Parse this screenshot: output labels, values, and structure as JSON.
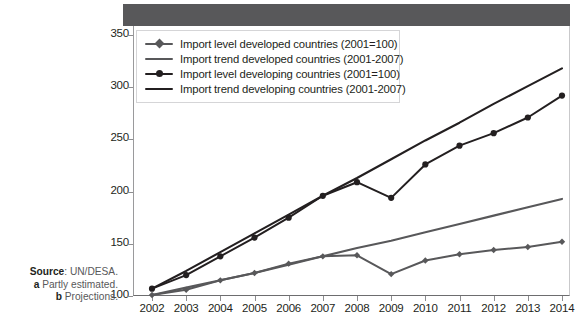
{
  "chart_data": {
    "type": "line",
    "title": "",
    "xlabel": "",
    "ylabel": "",
    "xlim": [
      2002,
      2014
    ],
    "ylim": [
      100,
      350
    ],
    "yticks": [
      100,
      150,
      200,
      250,
      300,
      350
    ],
    "grid": false,
    "legend_position": "top-left",
    "categories": [
      2002,
      2003,
      2004,
      2005,
      2006,
      2007,
      2008,
      2009,
      2010,
      2011,
      2012,
      2013,
      2014
    ],
    "series": [
      {
        "name": "Import level developed countries (2001=100)",
        "key": "developed_level",
        "color": "#58585a",
        "marker": "diamond",
        "values": [
          101,
          106,
          115,
          122,
          131,
          138,
          139,
          121,
          134,
          140,
          144,
          147,
          152
        ]
      },
      {
        "name": "Import trend developed countries (2001-2007)",
        "key": "developed_trend",
        "color": "#58585a",
        "marker": "none",
        "values": [
          101,
          108,
          115,
          122,
          130,
          138,
          146,
          153,
          161,
          169,
          177,
          185,
          193
        ]
      },
      {
        "name": "Import level developing countries (2001=100)",
        "key": "developing_level",
        "color": "#231f20",
        "marker": "circle",
        "values": [
          107,
          120,
          138,
          156,
          175,
          196,
          209,
          194,
          226,
          244,
          256,
          271,
          292
        ]
      },
      {
        "name": "Import trend developing countries (2001-2007)",
        "key": "developing_trend",
        "color": "#231f20",
        "marker": "none",
        "values": [
          107,
          124,
          142,
          160,
          178,
          196,
          213,
          231,
          249,
          266,
          284,
          301,
          318
        ]
      }
    ]
  },
  "header": {
    "band_color": "#58585a"
  },
  "axes": {
    "y_ticks": [
      "350",
      "300",
      "250",
      "200",
      "150",
      "100"
    ],
    "x_ticks": [
      "2002",
      "2003",
      "2004",
      "2005",
      "2006",
      "2007",
      "2008",
      "2009",
      "2010",
      "2011",
      "2012",
      "2013",
      "2014"
    ]
  },
  "legend": {
    "items": [
      {
        "label": "Import level developed countries (2001=100)",
        "color": "#58585a",
        "marker": "diamond"
      },
      {
        "label": "Import trend developed countries (2001-2007)",
        "color": "#58585a",
        "marker": "none"
      },
      {
        "label": "Import level developing countries (2001=100)",
        "color": "#231f20",
        "marker": "circle"
      },
      {
        "label": "Import trend developing countries (2001-2007)",
        "color": "#231f20",
        "marker": "none"
      }
    ]
  },
  "source": {
    "label": "Source",
    "colon_text": ": UN/DESA.",
    "note_a_marker": "a",
    "note_a_text": " Partly estimated.",
    "note_b_marker": "b",
    "note_b_text": " Projections."
  }
}
